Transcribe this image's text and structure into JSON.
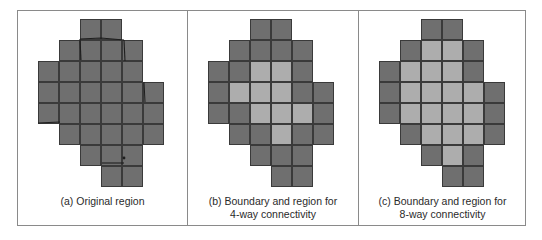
{
  "figure": {
    "colors": {
      "boundary": "#6f6f6f",
      "interior": "#adadad",
      "grid_line": "#3a3a3a",
      "frame": "#8a8a8a"
    },
    "legend_semantics": {
      "dark_cell": "boundary pixel",
      "light_cell": "interior region pixel"
    },
    "grid": {
      "rows": 8,
      "cols": 6,
      "cell_size_px": 21
    },
    "panels": [
      {
        "id": "a",
        "caption_lines": [
          "(a) Original region"
        ],
        "cells": [
          "..BB..",
          ".BBBB.",
          "BBBBB.",
          "BBBBBB",
          "BBBBBB",
          ".BBBBB",
          "..BBB.",
          "...BB."
        ]
      },
      {
        "id": "b",
        "caption_lines": [
          "(b) Boundary and region for",
          "4-way connectivity"
        ],
        "cells": [
          "..BB..",
          ".BBBB.",
          "BBIIB.",
          "BIIIBB",
          "BBIIIB",
          ".BBIBB",
          "..BBB.",
          "...BB."
        ]
      },
      {
        "id": "c",
        "caption_lines": [
          "(c) Boundary and region for",
          "8-way connectivity"
        ],
        "cells": [
          "..BB..",
          ".BIIB.",
          "BIIIB.",
          "BIIIIB",
          "BIIIIB",
          ".BIIIB",
          "..BIB.",
          "...BB."
        ]
      }
    ]
  }
}
